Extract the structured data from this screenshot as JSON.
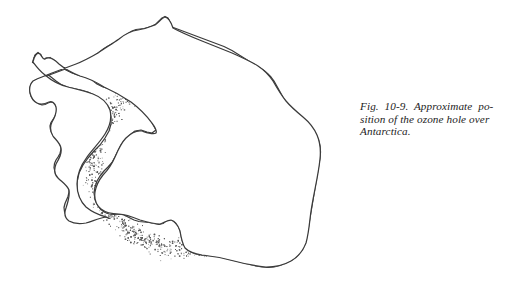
{
  "figure": {
    "number": "Fig. 10-9.",
    "caption_full": "Fig. 10-9. Approximate position of the ozone hole over Antarctica.",
    "caption_lines": [
      "Fig.  10-9.  Approximate  po-",
      "sition of the ozone hole over",
      "Antarctica."
    ],
    "subject": "Antarctica",
    "feature": "ozone hole"
  },
  "map": {
    "title": "Antarctica outline map",
    "landmass_label": "Antarctica",
    "overlay_label": "ozone hole stipple ring",
    "colors": {
      "coastline": "#3b3b3b",
      "land_fill": "#ffffff",
      "stipple": "#555555",
      "background": "#ffffff"
    },
    "ozone_ring": {
      "center_x": 184,
      "center_y": 162,
      "outer_radius": 106,
      "inner_radius": 76
    }
  }
}
